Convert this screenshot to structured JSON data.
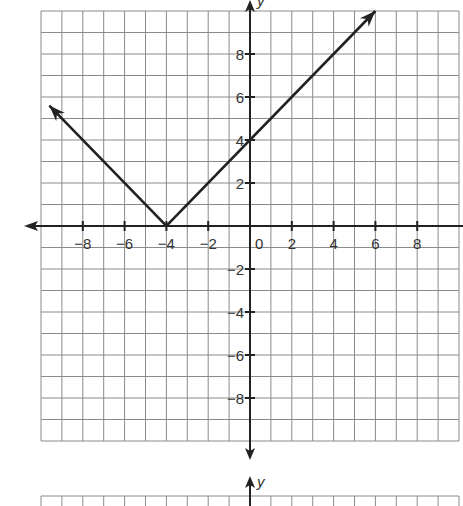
{
  "chart_data": {
    "type": "line",
    "title": "",
    "function": "y = |x + 4|",
    "xlabel": "x",
    "ylabel": "y",
    "xlim": [
      -10,
      10
    ],
    "ylim": [
      -10,
      10
    ],
    "grid": true,
    "x_ticks": [
      -8,
      -6,
      -4,
      -2,
      0,
      2,
      4,
      6,
      8
    ],
    "y_ticks": [
      -8,
      -6,
      -4,
      -2,
      2,
      4,
      6,
      8
    ],
    "series": [
      {
        "name": "graph",
        "points": [
          [
            -9.6,
            5.6
          ],
          [
            -4,
            0
          ],
          [
            6,
            10
          ]
        ],
        "arrows": "both"
      }
    ],
    "vertex": [
      -4,
      0
    ],
    "y_intercept": [
      0,
      4
    ]
  },
  "labels": {
    "x_ticks": [
      "−8",
      "−6",
      "−4",
      "−2",
      "0",
      "2",
      "4",
      "6",
      "8"
    ],
    "y_ticks_pos": [
      "2",
      "4",
      "6",
      "8"
    ],
    "y_ticks_neg": [
      "−2",
      "−4",
      "−6",
      "−8"
    ],
    "y_axis": "y",
    "second_y_axis": "y"
  }
}
